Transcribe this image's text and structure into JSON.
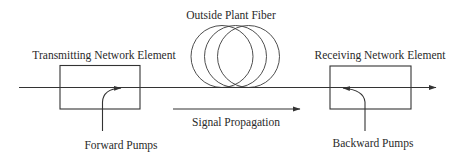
{
  "diagram": {
    "labels": {
      "fiber": "Outside Plant Fiber",
      "transmitting": "Transmitting Network Element",
      "receiving": "Receiving Network Element",
      "signal": "Signal Propagation",
      "forward_pumps": "Forward Pumps",
      "backward_pumps": "Backward Pumps"
    },
    "nodes": [
      {
        "id": "transmitting-element",
        "label": "Transmitting Network Element",
        "shape": "rectangle"
      },
      {
        "id": "fiber-coil",
        "label": "Outside Plant Fiber",
        "shape": "three-overlapping-circles"
      },
      {
        "id": "receiving-element",
        "label": "Receiving Network Element",
        "shape": "rectangle"
      }
    ],
    "edges": [
      {
        "from": "transmitting-element",
        "to": "receiving-element",
        "via": "fiber-coil",
        "type": "signal-line-arrow"
      },
      {
        "from": "forward-pumps",
        "to": "transmitting-element",
        "type": "curved-arrow",
        "label": "Forward Pumps"
      },
      {
        "from": "backward-pumps",
        "to": "receiving-element",
        "type": "curved-arrow",
        "label": "Backward Pumps"
      }
    ],
    "annotations": [
      {
        "type": "direction-arrow",
        "label": "Signal Propagation",
        "direction": "left-to-right"
      }
    ],
    "colors": {
      "line": "#333333",
      "text": "#2a2a2a",
      "background": "#ffffff"
    }
  }
}
